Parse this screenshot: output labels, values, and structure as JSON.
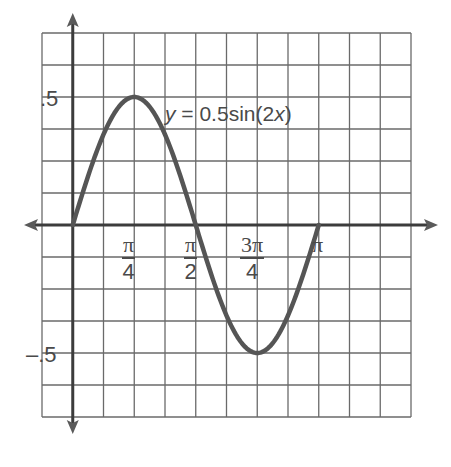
{
  "chart_data": {
    "type": "line",
    "title": "",
    "equation_label": "y = 0.5sin(2x)",
    "equation_parts": {
      "lhs": "y",
      "eq": " = 0.5sin(2",
      "var": "x",
      "close": ")"
    },
    "xlabel": "",
    "ylabel": "",
    "x_ticks": [
      {
        "value": 0.7854,
        "label_num": "π",
        "label_den": "4"
      },
      {
        "value": 1.5708,
        "label_num": "π",
        "label_den": "2"
      },
      {
        "value": 2.3562,
        "label_num": "3π",
        "label_den": "4"
      },
      {
        "value": 3.1416,
        "label": "π"
      }
    ],
    "y_ticks": [
      {
        "value": 0.5,
        "label": ".5"
      },
      {
        "value": -0.5,
        "label": "–.5"
      }
    ],
    "xlim": [
      -0.3927,
      4.3197
    ],
    "ylim": [
      -0.75,
      0.75
    ],
    "grid": true,
    "grid_cols": 12,
    "grid_rows": 12,
    "x_step": 0.3927,
    "y_step": 0.125,
    "series": [
      {
        "name": "y = 0.5sin(2x)",
        "domain": [
          0,
          3.1416
        ],
        "x": [
          0,
          0.3927,
          0.7854,
          1.1781,
          1.5708,
          1.9635,
          2.3562,
          2.7489,
          3.1416
        ],
        "values": [
          0,
          0.3536,
          0.5,
          0.3536,
          0,
          -0.3536,
          -0.5,
          -0.3536,
          0
        ]
      }
    ],
    "colors": {
      "curve": "#555555",
      "grid": "#6a6a6a",
      "axis": "#3c3c3c",
      "text": "#4a4a4a"
    }
  }
}
